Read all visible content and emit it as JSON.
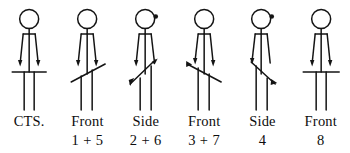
{
  "diagram": {
    "background_color": "#ffffff",
    "stroke_color": "#141414",
    "figure_count": 6,
    "figures": [
      {
        "id": "figure-cts",
        "view": "front",
        "has_nose_mark": false,
        "bar_type": "horizontal",
        "bar_description": "horizontal bar across hips",
        "label_line1": "CTS.",
        "label_line2": ""
      },
      {
        "id": "figure-front-1-5",
        "view": "front",
        "has_nose_mark": false,
        "bar_type": "diagonal-up-right",
        "bar_description": "bar tilted upward to the right",
        "label_line1": "Front",
        "label_line2": "1 + 5"
      },
      {
        "id": "figure-side-2-6",
        "view": "side",
        "has_nose_mark": true,
        "bar_type": "diagonal-up-right-steep",
        "bar_description": "bar tilted steeply upward to the right",
        "label_line1": "Side",
        "label_line2": "2 + 6"
      },
      {
        "id": "figure-front-3-7",
        "view": "front",
        "has_nose_mark": false,
        "bar_type": "diagonal-down-right",
        "bar_description": "bar tilted downward to the right",
        "label_line1": "Front",
        "label_line2": "3 + 7"
      },
      {
        "id": "figure-side-4",
        "view": "side",
        "has_nose_mark": true,
        "bar_type": "diagonal-down-right-steep",
        "bar_description": "bar tilted steeply downward to the right",
        "label_line1": "Side",
        "label_line2": "4"
      },
      {
        "id": "figure-front-8",
        "view": "front",
        "has_nose_mark": false,
        "bar_type": "horizontal",
        "bar_description": "horizontal bar across hips",
        "label_line1": "Front",
        "label_line2": "8"
      }
    ]
  }
}
